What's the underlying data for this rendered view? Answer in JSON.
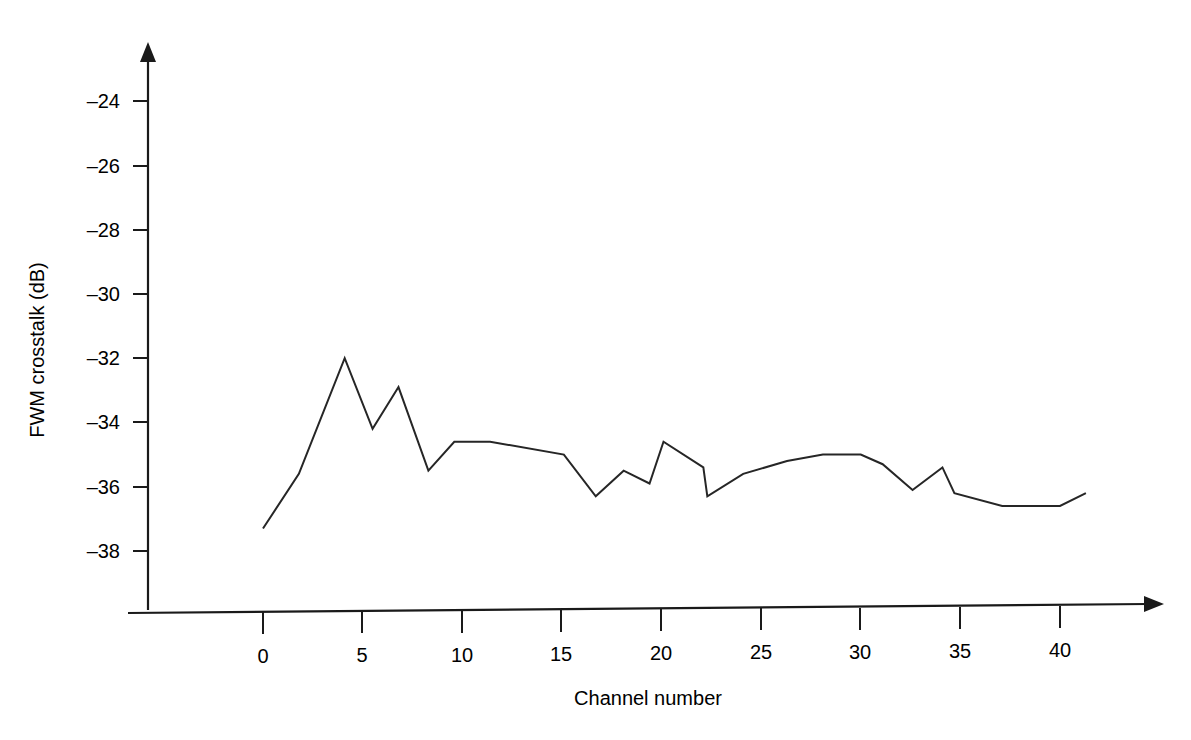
{
  "chart_data": {
    "type": "line",
    "title": "",
    "xlabel": "Channel number",
    "ylabel": "FWM crosstalk (dB)",
    "xlim": [
      -2.5,
      43
    ],
    "ylim": [
      -39.5,
      -23.0
    ],
    "xticks": [
      0,
      5,
      10,
      15,
      20,
      25,
      30,
      35,
      40
    ],
    "xtick_labels": [
      "0",
      "5",
      "10",
      "15",
      "20",
      "25",
      "30",
      "35",
      "40"
    ],
    "yticks": [
      -24,
      -26,
      -28,
      -30,
      -32,
      -34,
      -36,
      -38
    ],
    "ytick_labels": [
      "–24",
      "–26",
      "–28",
      "–30",
      "–32",
      "–34",
      "–36",
      "–38"
    ],
    "grid": false,
    "legend": null,
    "series": [
      {
        "name": "FWM crosstalk",
        "color": "#262626",
        "x": [
          0.0,
          1.8,
          4.1,
          5.5,
          6.8,
          8.3,
          9.6,
          11.4,
          15.1,
          16.7,
          18.1,
          19.4,
          20.1,
          22.1,
          22.3,
          24.1,
          26.3,
          28.1,
          30.0,
          31.1,
          32.6,
          34.1,
          34.7,
          37.1,
          40.0,
          41.3
        ],
        "y": [
          -37.3,
          -35.6,
          -32.0,
          -34.2,
          -32.9,
          -35.5,
          -34.6,
          -34.6,
          -35.0,
          -36.3,
          -35.5,
          -35.9,
          -34.6,
          -35.4,
          -36.3,
          -35.6,
          -35.2,
          -35.0,
          -35.0,
          -35.3,
          -36.1,
          -35.4,
          -36.2,
          -36.6,
          -36.6,
          -36.2
        ]
      }
    ]
  },
  "axes": {
    "y_axis_name": "FWM crosstalk (dB)",
    "x_axis_name": "Channel number"
  }
}
